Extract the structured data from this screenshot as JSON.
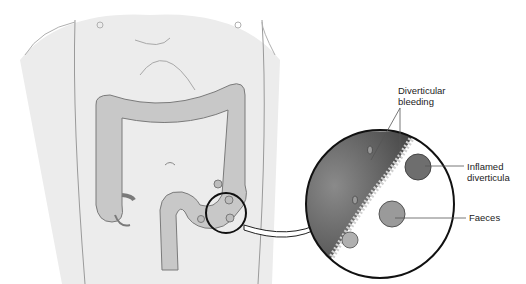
{
  "diagram": {
    "labels": {
      "bleeding_line1": "Diverticular",
      "bleeding_line2": "bleeding",
      "inflamed_line1": "Inflamed",
      "inflamed_line2": "diverticula",
      "faeces": "Faeces"
    },
    "colors": {
      "body": "#ececec",
      "body_outline": "#9a9a9a",
      "colon": "#c8c8c8",
      "colon_outline": "#7a7a7a",
      "wall_dark": "#5a5a5a",
      "mucosa": "#cfcfcf",
      "circle_outline": "#111111"
    }
  }
}
